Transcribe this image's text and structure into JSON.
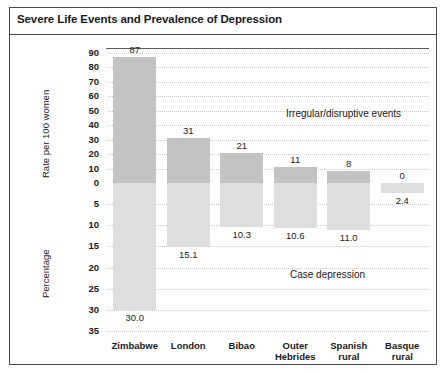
{
  "figure": {
    "title": "Severe Life Events and Prevalence of Depression"
  },
  "chart_data": {
    "type": "bar",
    "title": "Severe Life Events and Prevalence of Depression",
    "orientation": "vertical",
    "grid": true,
    "legend_position": "none",
    "categories": [
      "Zimbabwe",
      "London",
      "Bibao",
      "Outer Hebrides",
      "Spanish rural",
      "Basque rural"
    ],
    "category_labels": [
      "Zimbabwe",
      "London",
      "Bibao",
      "Outer\nHebrides",
      "Spanish\nrural",
      "Basque\nrural"
    ],
    "series": [
      {
        "name": "Irregular/disruptive events",
        "direction": "up",
        "axis": "Rate per 100 women",
        "values": [
          87,
          31,
          21,
          11,
          8,
          0
        ],
        "value_labels": [
          "87",
          "31",
          "21",
          "11",
          "8",
          "0"
        ],
        "color": "#c3c3c3"
      },
      {
        "name": "Case depression",
        "direction": "down",
        "axis": "Percentage",
        "values": [
          30.0,
          15.1,
          10.3,
          10.6,
          11.0,
          2.4
        ],
        "value_labels": [
          "30.0",
          "15.1",
          "10.3",
          "10.6",
          "11.0",
          "2.4"
        ],
        "color": "#dedede"
      }
    ],
    "upper_axis": {
      "label": "Rate per 100 women",
      "ticks": [
        90,
        80,
        70,
        60,
        50,
        40,
        30,
        20,
        10,
        0
      ],
      "tick_labels": [
        "90",
        "80",
        "70",
        "60",
        "50",
        "40",
        "30",
        "20",
        "10",
        "0"
      ],
      "range": [
        0,
        90
      ]
    },
    "lower_axis": {
      "label": "Percentage",
      "ticks": [
        5,
        10,
        15,
        20,
        25,
        30,
        35
      ],
      "tick_labels": [
        "5",
        "10",
        "15",
        "20",
        "25",
        "30",
        "35"
      ],
      "range": [
        0,
        35
      ]
    },
    "annotations": [
      {
        "text": "Irregular/disruptive events",
        "region": "upper"
      },
      {
        "text": "Case depression",
        "region": "lower"
      }
    ]
  }
}
